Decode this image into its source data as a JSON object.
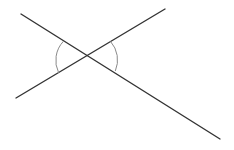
{
  "diagram": {
    "title": "",
    "type": "intersecting-lines-vertical-angles",
    "width": 234,
    "height": 150,
    "background": "#ffffff",
    "line_color": "#333333",
    "arc_color": "#8a8a8a",
    "intersection": {
      "x": 87,
      "y": 56
    },
    "lines": [
      {
        "name": "line-a",
        "x1": 21,
        "y1": 14,
        "x2": 220,
        "y2": 139
      },
      {
        "name": "line-b",
        "x1": 16,
        "y1": 98,
        "x2": 165,
        "y2": 9
      }
    ],
    "arcs": [
      {
        "name": "left-angle-arc",
        "d": "M 63.5 41.2 A 28 28 0 0 0 58.7 72.9"
      },
      {
        "name": "right-angle-arc",
        "d": "M 110.5 41.4 A 28 28 0 0 1 115.3 71.0"
      }
    ],
    "labels": []
  }
}
